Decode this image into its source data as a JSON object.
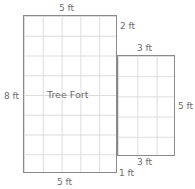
{
  "figure": {
    "interior_label": "Tree Fort",
    "colors": {
      "outline": "#8a8a8a",
      "gridline": "#dcdcdc",
      "label_text": "#6d6d6d",
      "background": "#ffffff"
    },
    "shapes": [
      {
        "name": "main-rectangle",
        "columns": 5,
        "rows": 8,
        "width_label": "5 ft",
        "height_label": "8 ft"
      },
      {
        "name": "side-rectangle",
        "columns": 3,
        "rows": 5,
        "width_label": "3 ft",
        "height_label": "5 ft"
      }
    ],
    "labels": {
      "top_width": "5 ft",
      "right_offset_top": "2 ft",
      "side_top_width": "3 ft",
      "left_height": "8 ft",
      "side_right_height": "5 ft",
      "side_bottom_width": "3 ft",
      "bottom_offset": "1 ft",
      "bottom_width": "5 ft"
    }
  },
  "chart_data": {
    "type": "diagram",
    "unit": "ft",
    "grid": true,
    "parts": [
      {
        "name": "Tree Fort",
        "shape": "rectangle",
        "width": 5,
        "height": 8,
        "area": 40,
        "grid_cells": 40
      },
      {
        "name": "attached section",
        "shape": "rectangle",
        "width": 3,
        "height": 5,
        "area": 15,
        "grid_cells": 15,
        "vertical_offset_from_top": 2,
        "vertical_offset_from_bottom": 1
      }
    ],
    "annotations": [
      "5 ft",
      "2 ft",
      "3 ft",
      "8 ft",
      "5 ft",
      "3 ft",
      "1 ft",
      "5 ft"
    ]
  }
}
